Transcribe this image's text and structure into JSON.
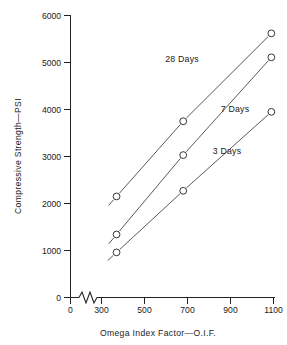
{
  "chart_data": {
    "type": "line",
    "title": "",
    "subtitle": "",
    "xlabel": "Omega Index Factor—O.I.F.",
    "ylabel": "Compressive Strength—PSI",
    "xlim": [
      0,
      1150
    ],
    "ylim": [
      0,
      6000
    ],
    "x_ticks": [
      0,
      300,
      500,
      700,
      900,
      1100
    ],
    "x_tick_labels": [
      "0",
      "300",
      "500",
      "700",
      "900",
      "1100"
    ],
    "y_ticks": [
      0,
      1000,
      2000,
      3000,
      4000,
      5000,
      6000
    ],
    "y_tick_labels": [
      "0",
      "1000",
      "2000",
      "3000",
      "4000",
      "5000",
      "6000"
    ],
    "grid": false,
    "legend_position": "inline-annotations",
    "axis_break": {
      "axis": "x",
      "symbol": "zigzag",
      "between": [
        0,
        300
      ]
    },
    "marker": "open-circle",
    "x": [
      370,
      680,
      1090
    ],
    "series": [
      {
        "name": "28 Days",
        "values": [
          2150,
          3750,
          5620
        ],
        "label_x": 640,
        "label_y": 4620
      },
      {
        "name": "7 Days",
        "values": [
          1340,
          3030,
          5110
        ],
        "label_x": 880,
        "label_y": 3990
      },
      {
        "name": "3 Days",
        "values": [
          960,
          2270,
          3950
        ],
        "label_x": 890,
        "label_y": 3110
      }
    ],
    "annotations": [
      "28 Days",
      "7 Days",
      "3 Days"
    ],
    "colors": {
      "line": "#3a3a3a",
      "marker_fill": "#ffffff",
      "marker_stroke": "#2b2b2b",
      "axis": "#222222",
      "text": "#1a1a1a",
      "background": "#ffffff"
    }
  },
  "axes": {
    "y_title": "Compressive Strength—PSI",
    "x_title": "Omega Index Factor—O.I.F.",
    "y_labels": [
      "6000",
      "5000",
      "4000",
      "3000",
      "2000",
      "1000",
      "0"
    ],
    "x_labels": [
      "0",
      "300",
      "500",
      "700",
      "900",
      "1100"
    ]
  },
  "series_labels": {
    "s28": "28 Days",
    "s7": "7 Days",
    "s3": "3 Days"
  }
}
